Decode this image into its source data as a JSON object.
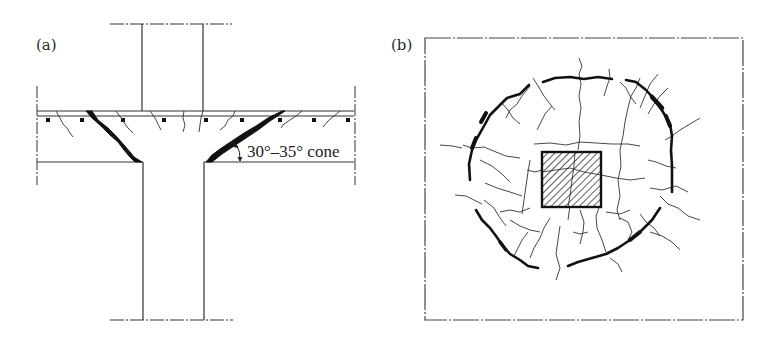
{
  "figure": {
    "panel_a": {
      "label": "(a)",
      "title": "Section through slab-column connection",
      "annotation": "30°–35° cone",
      "elements": [
        "column",
        "slab",
        "top reinforcement bars",
        "punching shear crack cone",
        "flexural cracks",
        "break lines"
      ]
    },
    "panel_b": {
      "label": "(b)",
      "title": "Plan view of slab tension surface",
      "elements": [
        "slab outline (break lines)",
        "hatched column",
        "circumferential punching crack",
        "radial cracks"
      ]
    }
  },
  "colors": {
    "ink": "#1a1a1a",
    "background": "#ffffff"
  }
}
